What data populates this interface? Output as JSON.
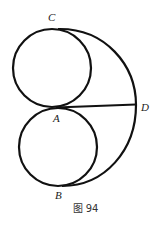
{
  "figure": {
    "caption": "图 94",
    "points": {
      "A": {
        "label": "A",
        "x": 56,
        "y": 107
      },
      "B": {
        "label": "B",
        "x": 62,
        "y": 186
      },
      "C": {
        "label": "C",
        "x": 62,
        "y": 29
      },
      "D": {
        "label": "D",
        "x": 136,
        "y": 105
      }
    },
    "shapes": {
      "upper_circle": {
        "cx": 52,
        "cy": 68,
        "r": 39
      },
      "lower_circle": {
        "cx": 58,
        "cy": 147,
        "r": 39
      },
      "outer_arc": {
        "from": "C",
        "through": "D",
        "to": "B"
      },
      "segment": {
        "from": "A",
        "to": "D"
      }
    },
    "stroke_color": "#111111"
  }
}
